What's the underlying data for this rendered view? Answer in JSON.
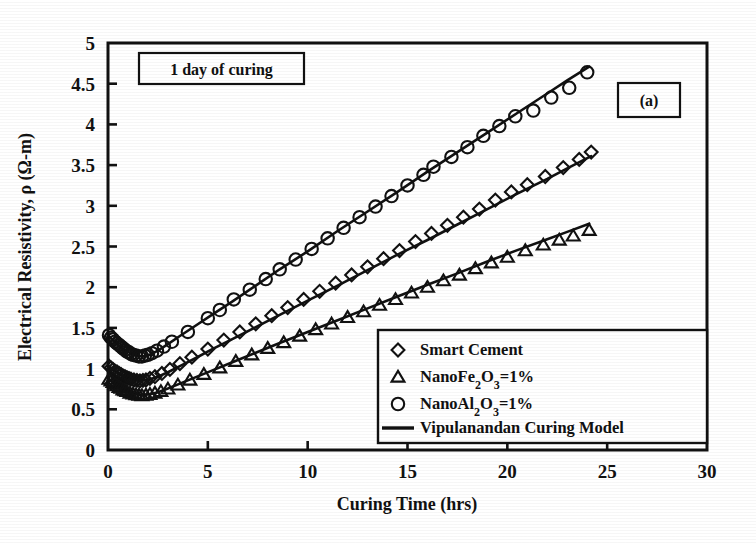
{
  "figure": {
    "panel_label": "(a)",
    "annotation": "1 day of curing"
  },
  "axes": {
    "x_title": "Curing Time (hrs)",
    "y_title_pre": "Electrical Resistivity, ",
    "y_title_rho": "ρ",
    "y_title_post": " (Ω-m)",
    "x_ticks": [
      "0",
      "5",
      "10",
      "15",
      "20",
      "25",
      "30"
    ],
    "y_ticks": [
      "0",
      "0.5",
      "1",
      "1.5",
      "2",
      "2.5",
      "3",
      "3.5",
      "4",
      "4.5",
      "5"
    ]
  },
  "legend": {
    "items": [
      {
        "marker": "diamond-marker",
        "label": "Smart Cement"
      },
      {
        "marker": "triangle-marker",
        "label": "NanoFe2O3=1%",
        "parts": [
          "NanoFe",
          "2",
          "O",
          "3",
          "=1%"
        ]
      },
      {
        "marker": "circle-marker",
        "label": "NanoAl2O3=1%",
        "parts": [
          "NanoAl",
          "2",
          "O",
          "3",
          "=1%"
        ]
      },
      {
        "marker": "line-marker",
        "label": "Vipulanandan Curing Model"
      }
    ]
  },
  "chart_data": {
    "type": "scatter",
    "title": "",
    "xlabel": "Curing Time (hrs)",
    "ylabel": "Electrical Resistivity, ρ (Ω-m)",
    "xlim": [
      0,
      30
    ],
    "ylim": [
      0,
      5
    ],
    "xticks": [
      0,
      5,
      10,
      15,
      20,
      25,
      30
    ],
    "yticks": [
      0,
      0.5,
      1,
      1.5,
      2,
      2.5,
      3,
      3.5,
      4,
      4.5,
      5
    ],
    "grid": false,
    "legend_position": "lower-right",
    "annotations": [
      "1 day of curing",
      "(a)"
    ],
    "series": [
      {
        "name": "NanoAl2O3=1%",
        "marker": "circle",
        "points": [
          [
            0.05,
            1.41
          ],
          [
            0.15,
            1.38
          ],
          [
            0.25,
            1.36
          ],
          [
            0.35,
            1.33
          ],
          [
            0.45,
            1.31
          ],
          [
            0.55,
            1.29
          ],
          [
            0.65,
            1.27
          ],
          [
            0.75,
            1.25
          ],
          [
            0.85,
            1.23
          ],
          [
            0.95,
            1.21
          ],
          [
            1.05,
            1.2
          ],
          [
            1.15,
            1.18
          ],
          [
            1.25,
            1.17
          ],
          [
            1.4,
            1.16
          ],
          [
            1.55,
            1.15
          ],
          [
            1.7,
            1.15
          ],
          [
            1.85,
            1.16
          ],
          [
            2.0,
            1.17
          ],
          [
            2.2,
            1.19
          ],
          [
            2.45,
            1.22
          ],
          [
            2.8,
            1.27
          ],
          [
            3.2,
            1.33
          ],
          [
            4.0,
            1.45
          ],
          [
            5.0,
            1.62
          ],
          [
            5.6,
            1.72
          ],
          [
            6.3,
            1.85
          ],
          [
            7.1,
            1.97
          ],
          [
            7.9,
            2.1
          ],
          [
            8.6,
            2.22
          ],
          [
            9.4,
            2.34
          ],
          [
            10.2,
            2.47
          ],
          [
            11.0,
            2.6
          ],
          [
            11.8,
            2.73
          ],
          [
            12.6,
            2.86
          ],
          [
            13.4,
            2.99
          ],
          [
            14.2,
            3.12
          ],
          [
            15.0,
            3.25
          ],
          [
            15.8,
            3.38
          ],
          [
            16.3,
            3.48
          ],
          [
            17.2,
            3.6
          ],
          [
            18.0,
            3.72
          ],
          [
            18.8,
            3.86
          ],
          [
            19.6,
            3.98
          ],
          [
            20.4,
            4.1
          ],
          [
            21.3,
            4.17
          ],
          [
            22.2,
            4.33
          ],
          [
            23.1,
            4.45
          ],
          [
            24.0,
            4.64
          ]
        ]
      },
      {
        "name": "Smart Cement",
        "marker": "diamond",
        "points": [
          [
            0.05,
            1.03
          ],
          [
            0.15,
            1.01
          ],
          [
            0.25,
            0.99
          ],
          [
            0.35,
            0.97
          ],
          [
            0.45,
            0.96
          ],
          [
            0.55,
            0.94
          ],
          [
            0.65,
            0.93
          ],
          [
            0.75,
            0.91
          ],
          [
            0.85,
            0.9
          ],
          [
            0.95,
            0.89
          ],
          [
            1.05,
            0.88
          ],
          [
            1.15,
            0.87
          ],
          [
            1.3,
            0.86
          ],
          [
            1.45,
            0.855
          ],
          [
            1.6,
            0.85
          ],
          [
            1.75,
            0.855
          ],
          [
            1.9,
            0.86
          ],
          [
            2.1,
            0.88
          ],
          [
            2.35,
            0.9
          ],
          [
            2.7,
            0.94
          ],
          [
            3.1,
            0.99
          ],
          [
            3.6,
            1.06
          ],
          [
            4.2,
            1.14
          ],
          [
            5.0,
            1.24
          ],
          [
            5.8,
            1.35
          ],
          [
            6.6,
            1.45
          ],
          [
            7.4,
            1.55
          ],
          [
            8.2,
            1.65
          ],
          [
            9.0,
            1.75
          ],
          [
            9.8,
            1.85
          ],
          [
            10.6,
            1.95
          ],
          [
            11.4,
            2.05
          ],
          [
            12.2,
            2.15
          ],
          [
            13.0,
            2.25
          ],
          [
            13.8,
            2.35
          ],
          [
            14.6,
            2.45
          ],
          [
            15.4,
            2.56
          ],
          [
            16.2,
            2.66
          ],
          [
            17.0,
            2.76
          ],
          [
            17.8,
            2.86
          ],
          [
            18.6,
            2.96
          ],
          [
            19.4,
            3.07
          ],
          [
            20.2,
            3.17
          ],
          [
            21.0,
            3.26
          ],
          [
            21.9,
            3.36
          ],
          [
            22.8,
            3.47
          ],
          [
            23.6,
            3.57
          ],
          [
            24.2,
            3.66
          ]
        ]
      },
      {
        "name": "NanoFe2O3=1%",
        "marker": "triangle",
        "points": [
          [
            0.05,
            0.87
          ],
          [
            0.15,
            0.85
          ],
          [
            0.25,
            0.83
          ],
          [
            0.35,
            0.81
          ],
          [
            0.45,
            0.79
          ],
          [
            0.55,
            0.77
          ],
          [
            0.65,
            0.76
          ],
          [
            0.75,
            0.74
          ],
          [
            0.85,
            0.73
          ],
          [
            0.95,
            0.72
          ],
          [
            1.1,
            0.7
          ],
          [
            1.25,
            0.69
          ],
          [
            1.4,
            0.68
          ],
          [
            1.55,
            0.675
          ],
          [
            1.7,
            0.67
          ],
          [
            1.9,
            0.675
          ],
          [
            2.1,
            0.685
          ],
          [
            2.35,
            0.7
          ],
          [
            2.65,
            0.72
          ],
          [
            3.0,
            0.75
          ],
          [
            3.5,
            0.8
          ],
          [
            4.1,
            0.86
          ],
          [
            4.8,
            0.93
          ],
          [
            5.6,
            1.01
          ],
          [
            6.4,
            1.09
          ],
          [
            7.2,
            1.17
          ],
          [
            8.0,
            1.25
          ],
          [
            8.8,
            1.32
          ],
          [
            9.6,
            1.4
          ],
          [
            10.4,
            1.48
          ],
          [
            11.2,
            1.55
          ],
          [
            12.0,
            1.63
          ],
          [
            12.8,
            1.7
          ],
          [
            13.6,
            1.78
          ],
          [
            14.4,
            1.85
          ],
          [
            15.2,
            1.93
          ],
          [
            16.0,
            2.0
          ],
          [
            16.8,
            2.08
          ],
          [
            17.6,
            2.15
          ],
          [
            18.4,
            2.23
          ],
          [
            19.2,
            2.3
          ],
          [
            20.0,
            2.37
          ],
          [
            20.9,
            2.45
          ],
          [
            21.8,
            2.52
          ],
          [
            22.6,
            2.58
          ],
          [
            23.3,
            2.63
          ],
          [
            24.1,
            2.7
          ]
        ]
      }
    ],
    "model_curves": [
      {
        "name": "Vipulanandan Curing Model - NanoAl2O3",
        "points": [
          [
            0.05,
            1.4
          ],
          [
            0.3,
            1.33
          ],
          [
            0.6,
            1.27
          ],
          [
            0.9,
            1.22
          ],
          [
            1.2,
            1.18
          ],
          [
            1.5,
            1.155
          ],
          [
            1.8,
            1.15
          ],
          [
            2.1,
            1.17
          ],
          [
            2.5,
            1.22
          ],
          [
            3.0,
            1.3
          ],
          [
            3.6,
            1.4
          ],
          [
            4.4,
            1.53
          ],
          [
            5.2,
            1.66
          ],
          [
            6.2,
            1.82
          ],
          [
            7.4,
            2.02
          ],
          [
            8.6,
            2.22
          ],
          [
            10.0,
            2.44
          ],
          [
            11.5,
            2.69
          ],
          [
            13.0,
            2.93
          ],
          [
            14.5,
            3.17
          ],
          [
            16.0,
            3.42
          ],
          [
            17.5,
            3.66
          ],
          [
            19.0,
            3.9
          ],
          [
            20.5,
            4.14
          ],
          [
            22.0,
            4.38
          ],
          [
            23.0,
            4.54
          ],
          [
            24.1,
            4.71
          ]
        ]
      },
      {
        "name": "Vipulanandan Curing Model - Smart Cement",
        "points": [
          [
            0.05,
            1.03
          ],
          [
            0.3,
            0.98
          ],
          [
            0.6,
            0.93
          ],
          [
            0.9,
            0.895
          ],
          [
            1.2,
            0.872
          ],
          [
            1.5,
            0.858
          ],
          [
            1.8,
            0.856
          ],
          [
            2.1,
            0.868
          ],
          [
            2.5,
            0.9
          ],
          [
            3.0,
            0.955
          ],
          [
            3.6,
            1.03
          ],
          [
            4.4,
            1.13
          ],
          [
            5.2,
            1.235
          ],
          [
            6.2,
            1.36
          ],
          [
            7.4,
            1.51
          ],
          [
            8.6,
            1.66
          ],
          [
            10.0,
            1.835
          ],
          [
            11.5,
            2.02
          ],
          [
            13.0,
            2.21
          ],
          [
            14.5,
            2.4
          ],
          [
            16.0,
            2.58
          ],
          [
            17.5,
            2.77
          ],
          [
            19.0,
            2.96
          ],
          [
            20.5,
            3.15
          ],
          [
            22.0,
            3.33
          ],
          [
            23.0,
            3.46
          ],
          [
            24.2,
            3.61
          ]
        ]
      },
      {
        "name": "Vipulanandan Curing Model - NanoFe2O3",
        "points": [
          [
            0.05,
            0.87
          ],
          [
            0.3,
            0.82
          ],
          [
            0.6,
            0.775
          ],
          [
            0.9,
            0.73
          ],
          [
            1.2,
            0.7
          ],
          [
            1.5,
            0.682
          ],
          [
            1.8,
            0.675
          ],
          [
            2.1,
            0.685
          ],
          [
            2.5,
            0.71
          ],
          [
            3.0,
            0.755
          ],
          [
            3.6,
            0.815
          ],
          [
            4.4,
            0.895
          ],
          [
            5.2,
            0.975
          ],
          [
            6.2,
            1.075
          ],
          [
            7.4,
            1.195
          ],
          [
            8.6,
            1.315
          ],
          [
            10.0,
            1.45
          ],
          [
            11.5,
            1.595
          ],
          [
            13.0,
            1.74
          ],
          [
            14.5,
            1.885
          ],
          [
            16.0,
            2.03
          ],
          [
            17.5,
            2.17
          ],
          [
            19.0,
            2.315
          ],
          [
            20.5,
            2.455
          ],
          [
            22.0,
            2.59
          ],
          [
            23.0,
            2.68
          ],
          [
            24.1,
            2.78
          ]
        ]
      }
    ]
  }
}
